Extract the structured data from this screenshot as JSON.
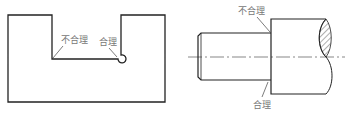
{
  "figures": [
    {
      "name": "slot-part",
      "labels": {
        "unreasonable": "不合理",
        "reasonable": "合理"
      }
    },
    {
      "name": "shaft-part",
      "labels": {
        "unreasonable": "不合理",
        "reasonable": "合理"
      }
    }
  ],
  "colors": {
    "line": "#222222",
    "label": "#777777"
  }
}
